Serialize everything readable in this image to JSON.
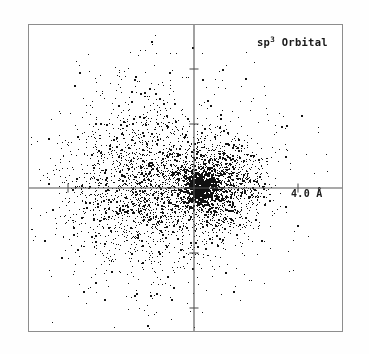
{
  "figure": {
    "background_color": "#fefefe",
    "frame_color": "#8d8d8d",
    "axis_color": "#555555",
    "point_color": "#111111",
    "width": 369,
    "height": 354
  },
  "plot": {
    "frame": {
      "x": 28,
      "y": 24,
      "width": 315,
      "height": 308
    },
    "origin": {
      "x": 165,
      "y": 163
    },
    "title_label": "sp",
    "title_superscript": "3",
    "title_suffix": " Orbital",
    "title_full": "sp3 Orbital",
    "scale_label": "4.0 Å",
    "scale_value": 4.0,
    "scale_unit": "Å",
    "scale_tick_x": 269,
    "scale_pixels_per_unit": 26
  },
  "axes": {
    "horizontal": {
      "y": 163,
      "x_start": 0,
      "x_end": 315
    },
    "vertical": {
      "x": 165,
      "y_start": 0,
      "y_end": 308
    },
    "tick_length": 9,
    "x_ticks": [
      {
        "x": 39,
        "label": ""
      },
      {
        "x": 269,
        "label": "4.0 Å"
      }
    ],
    "y_ticks": [
      {
        "y": 44,
        "label": ""
      },
      {
        "y": 99,
        "label": ""
      },
      {
        "y": 228,
        "label": ""
      },
      {
        "y": 283,
        "label": ""
      }
    ]
  },
  "chart_data": {
    "type": "scatter",
    "title": "sp3 Orbital",
    "xlabel": "",
    "ylabel": "",
    "annotations": [
      {
        "text": "sp3 Orbital",
        "position": "top-right"
      },
      {
        "text": "4.0 Å",
        "position": "on-positive-x-axis"
      }
    ],
    "grid": false,
    "legend": false,
    "axis_style": "crosshair",
    "units": "Angstrom",
    "xlim": [
      -6.35,
      5.77
    ],
    "ylim": [
      -5.58,
      6.27
    ],
    "total_points": 4200,
    "clusters": [
      {
        "name": "major-lobe",
        "role": "large left lobe",
        "center_px": {
          "x": 118,
          "y": 160
        },
        "center_units": {
          "x": -1.81,
          "y": 0.12
        },
        "sigma_px": {
          "x": 40,
          "y": 42
        },
        "radius_px": 105,
        "n_points": 2100,
        "density_profile": "gaussian-decaying-outward"
      },
      {
        "name": "minor-lobe",
        "role": "small right lobe",
        "center_px": {
          "x": 191,
          "y": 160
        },
        "center_units": {
          "x": 1.0,
          "y": 0.12
        },
        "sigma_px": {
          "x": 24,
          "y": 24
        },
        "radius_px": 62,
        "n_points": 1250,
        "density_profile": "gaussian-decaying-outward"
      },
      {
        "name": "nucleus-core",
        "role": "dense core at origin",
        "center_px": {
          "x": 170,
          "y": 162
        },
        "center_units": {
          "x": 0.19,
          "y": 0.04
        },
        "sigma_px": {
          "x": 8,
          "y": 9
        },
        "radius_px": 20,
        "n_points": 560,
        "density_profile": "very-dense-compact"
      },
      {
        "name": "diffuse-halo",
        "role": "sparse scattered outliers",
        "center_px": {
          "x": 140,
          "y": 160
        },
        "center_units": {
          "x": -0.96,
          "y": 0.12
        },
        "sigma_px": {
          "x": 75,
          "y": 72
        },
        "radius_px": 160,
        "n_points": 290,
        "density_profile": "sparse-uniform-tail"
      }
    ],
    "point_size_px": 1.5,
    "seed": 20240317
  }
}
